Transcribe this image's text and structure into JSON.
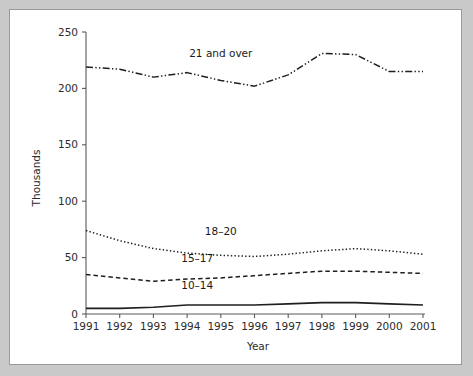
{
  "chart_data": {
    "type": "line",
    "title": "",
    "xlabel": "Year",
    "ylabel": "Thousands",
    "grid": false,
    "legend_position": "inline-labels",
    "x": [
      1991,
      1992,
      1993,
      1994,
      1995,
      1996,
      1997,
      1998,
      1999,
      2000,
      2001
    ],
    "xtick_labels": [
      "1991",
      "1992",
      "1993",
      "1994",
      "1995",
      "1996",
      "1997",
      "1998",
      "1999",
      "2000",
      "2001"
    ],
    "ytick_labels": [
      "0",
      "50",
      "100",
      "150",
      "200",
      "250"
    ],
    "ytick_values": [
      0,
      50,
      100,
      150,
      200,
      250
    ],
    "xlim": [
      1991,
      2001
    ],
    "ylim": [
      0,
      250
    ],
    "series": [
      {
        "name": "21 and over",
        "label": "21 and over",
        "dash": "dash-dot-dot",
        "values": [
          219,
          217,
          210,
          214,
          207,
          202,
          212,
          231,
          230,
          215,
          215
        ]
      },
      {
        "name": "18-20",
        "label": "18–20",
        "dash": "dotted",
        "values": [
          74,
          65,
          58,
          54,
          52,
          51,
          53,
          56,
          58,
          56,
          53
        ]
      },
      {
        "name": "15-17",
        "label": "15–17",
        "dash": "dashed",
        "values": [
          35,
          32,
          29,
          31,
          32,
          34,
          36,
          38,
          38,
          37,
          36
        ]
      },
      {
        "name": "10-14",
        "label": "10–14",
        "dash": "solid",
        "values": [
          5,
          5,
          6,
          8,
          8,
          8,
          9,
          10,
          10,
          9,
          8
        ]
      }
    ],
    "series_label_positions": [
      {
        "name": "21 and over",
        "x_year": 1995.0,
        "y_value": 228
      },
      {
        "name": "18-20",
        "x_year": 1995.0,
        "y_value": 70
      },
      {
        "name": "15-17",
        "x_year": 1994.3,
        "y_value": 46
      },
      {
        "name": "10-14",
        "x_year": 1994.3,
        "y_value": 22
      }
    ],
    "colors": {
      "line": "#1f1f1f",
      "axis": "#5a5a5a",
      "text": "#2b2b2b",
      "panel_background": "#ffffff",
      "page_background": "#c9c9c9"
    }
  }
}
